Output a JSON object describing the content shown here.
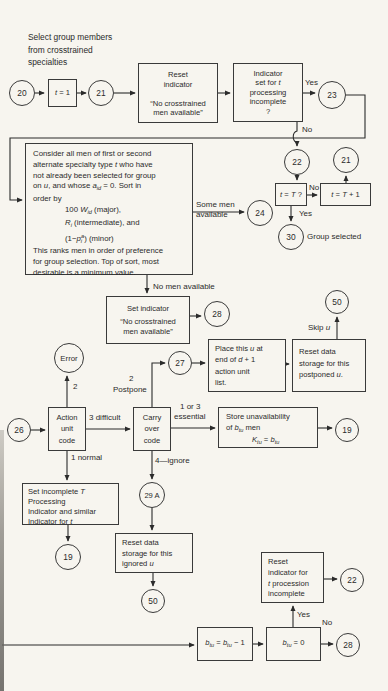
{
  "figure": {
    "background": "#f7f5ef",
    "ink": "#2b2b2b",
    "annotation": [
      "Select group members",
      "from crosstrained",
      "specialties"
    ]
  },
  "circles": {
    "c20": "20",
    "c21a": "21",
    "c23": "23",
    "c22a": "22",
    "c21b": "21",
    "c30": "30",
    "c24": "24",
    "c28a": "28",
    "c50a": "50",
    "cerr": "Error",
    "c27": "27",
    "c26": "26",
    "c19a": "19",
    "c19b": "19",
    "c29a": "29 A",
    "c50b": "50",
    "c22b": "22",
    "c28b": "28"
  },
  "boxes": {
    "t1": {
      "lines": [
        [
          {
            "i": "t"
          },
          {
            "t": " = 1"
          }
        ]
      ]
    },
    "reset1": {
      "lines": [
        [
          {
            "t": "Reset"
          }
        ],
        [
          {
            "t": "indicator"
          }
        ],
        [
          {
            "t": " "
          }
        ],
        [
          {
            "t": "“No crosstrained"
          }
        ],
        [
          {
            "t": "men available”"
          }
        ]
      ]
    },
    "ind": {
      "lines": [
        [
          {
            "t": "Indicator"
          }
        ],
        [
          {
            "t": "set for "
          },
          {
            "i": "t"
          }
        ],
        [
          {
            "t": "processing"
          }
        ],
        [
          {
            "t": "incomplete"
          }
        ],
        [
          {
            "t": "?"
          }
        ]
      ]
    },
    "big": {
      "lines": [
        [
          {
            "t": "Consider all men of first or second"
          }
        ],
        [
          {
            "t": "alternate specialty type "
          },
          {
            "i": "t"
          },
          {
            "t": " who have"
          }
        ],
        [
          {
            "t": "not already been selected for group"
          }
        ],
        [
          {
            "t": "on "
          },
          {
            "i": "u"
          },
          {
            "t": ", and whose "
          },
          {
            "i": "a"
          },
          {
            "sub": "id"
          },
          {
            "t": " = 0. Sort in"
          }
        ],
        [
          {
            "t": "order by"
          }
        ],
        [
          {
            "t": "100 "
          },
          {
            "i": "W"
          },
          {
            "sub": "id"
          },
          {
            "t": " (major),"
          }
        ],
        [
          {
            "i": "R"
          },
          {
            "sub": "i"
          },
          {
            "t": " (intermediate), and"
          }
        ],
        [
          {
            "t": "(1−"
          },
          {
            "i": "p"
          },
          {
            "sub": "i"
          },
          {
            "sup": "a"
          },
          {
            "t": ") (minor)"
          }
        ],
        [
          {
            "t": "This ranks men in order of preference"
          }
        ],
        [
          {
            "t": "for group selection. Top of sort, most"
          }
        ],
        [
          {
            "t": "desirable is a minimum value."
          }
        ]
      ]
    },
    "tT": {
      "lines": [
        [
          {
            "i": "t"
          },
          {
            "t": " = "
          },
          {
            "i": "T"
          },
          {
            "t": " ?"
          }
        ]
      ]
    },
    "tT1": {
      "lines": [
        [
          {
            "i": "t"
          },
          {
            "t": " = "
          },
          {
            "i": "T"
          },
          {
            "t": " + 1"
          }
        ]
      ]
    },
    "setind": {
      "lines": [
        [
          {
            "t": "Set indicator"
          }
        ],
        [
          {
            "t": " "
          }
        ],
        [
          {
            "t": "“No crosstrained"
          }
        ],
        [
          {
            "t": "men available”"
          }
        ]
      ]
    },
    "place": {
      "lines": [
        [
          {
            "t": "Place this "
          },
          {
            "i": "u"
          },
          {
            "t": " at"
          }
        ],
        [
          {
            "t": "end of "
          },
          {
            "i": "d"
          },
          {
            "t": " + 1"
          }
        ],
        [
          {
            "t": "action unit"
          }
        ],
        [
          {
            "t": "list."
          }
        ]
      ]
    },
    "resetpost": {
      "lines": [
        [
          {
            "t": "Reset data"
          }
        ],
        [
          {
            "t": "storage for this"
          }
        ],
        [
          {
            "t": "postponed "
          },
          {
            "i": "u"
          },
          {
            "t": "."
          }
        ]
      ]
    },
    "auc": {
      "lines": [
        [
          {
            "t": "Action"
          }
        ],
        [
          {
            "t": "unit"
          }
        ],
        [
          {
            "t": "code"
          }
        ]
      ]
    },
    "coc": {
      "lines": [
        [
          {
            "t": "Carry"
          }
        ],
        [
          {
            "t": "over"
          }
        ],
        [
          {
            "t": "code"
          }
        ]
      ]
    },
    "store": {
      "lines": [
        [
          {
            "t": "Store unavailability"
          }
        ],
        [
          {
            "t": "of "
          },
          {
            "i": "b"
          },
          {
            "sub": "tu"
          },
          {
            "t": " men"
          }
        ],
        [
          {
            "i": "K"
          },
          {
            "sub": "tu"
          },
          {
            "t": " = "
          },
          {
            "i": "b"
          },
          {
            "sub": "tu"
          }
        ]
      ]
    },
    "setinc": {
      "lines": [
        [
          {
            "t": "Set incomplete "
          },
          {
            "i": "T"
          }
        ],
        [
          {
            "t": "Processing"
          }
        ],
        [
          {
            "t": "Indicator and similar"
          }
        ],
        [
          {
            "t": "Indicator for "
          },
          {
            "i": "t"
          }
        ]
      ]
    },
    "resetign": {
      "lines": [
        [
          {
            "t": "Reset data"
          }
        ],
        [
          {
            "t": "storage for this"
          }
        ],
        [
          {
            "t": "ignored "
          },
          {
            "i": "u"
          }
        ]
      ]
    },
    "resetproc": {
      "lines": [
        [
          {
            "t": "Reset"
          }
        ],
        [
          {
            "t": "indicator for"
          }
        ],
        [
          {
            "i": "t"
          },
          {
            "t": " procession"
          }
        ],
        [
          {
            "t": "incomplete"
          }
        ]
      ]
    },
    "b1": {
      "lines": [
        [
          {
            "i": "b"
          },
          {
            "sub": "tu"
          },
          {
            "t": " = "
          },
          {
            "i": "b"
          },
          {
            "sub": "tu"
          },
          {
            "t": " − 1"
          }
        ]
      ]
    },
    "b2": {
      "lines": [
        [
          {
            "i": "b"
          },
          {
            "sub": "tu"
          },
          {
            "t": " = 0"
          }
        ]
      ]
    }
  },
  "labels": {
    "yes_top": "Yes",
    "no_top": "No",
    "some_men_1": "Some men",
    "some_men_2": "available",
    "no_tT": "No",
    "yes_tT": "Yes",
    "group_selected": "Group selected",
    "no_men": "No men available",
    "skip_u": [
      {
        "t": "Skip "
      },
      {
        "i": "u"
      }
    ],
    "err_2": "2",
    "post_2": "2",
    "postpone": "Postpone",
    "difficult": "3 difficult",
    "or13": "1 or 3",
    "essential": "essential",
    "normal": "1 normal",
    "ignore": "4—ignore",
    "yes_bot": "Yes",
    "no_bot": "No"
  }
}
